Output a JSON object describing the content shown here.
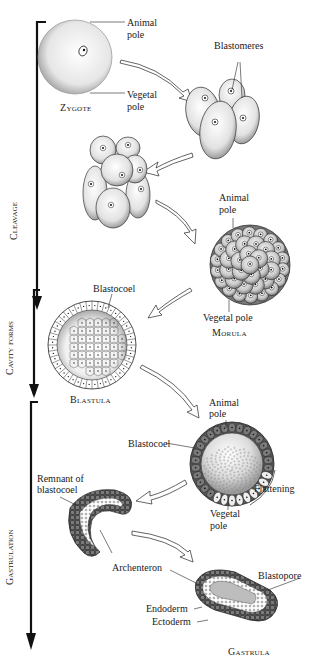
{
  "phases": [
    {
      "id": "cleavage",
      "label": "Cleavage"
    },
    {
      "id": "cavity",
      "label": "Cavity forms"
    },
    {
      "id": "gastrulation",
      "label": "Gastrulation"
    }
  ],
  "stages": {
    "zygote": {
      "name": "Zygote",
      "labels": {
        "animal_pole": "Animal\npole",
        "vegetal_pole": "Vegetal\npole"
      }
    },
    "four_cell": {
      "labels": {
        "blastomeres": "Blastomeres"
      }
    },
    "eight_cell": {},
    "morula": {
      "name": "Morula",
      "labels": {
        "animal_pole": "Animal\npole",
        "vegetal_pole": "Vegetal pole"
      }
    },
    "blastula": {
      "name": "Blastula",
      "labels": {
        "blastocoel": "Blastocoel"
      }
    },
    "early_gastrula": {
      "labels": {
        "animal_pole": "Animal\npole",
        "blastocoel": "Blastocoel",
        "flattening": "Flattening",
        "vegetal_pole": "Vegetal\npole"
      }
    },
    "mid_gastrula": {
      "labels": {
        "remnant": "Remnant of\nblastocoel",
        "archenteron": "Archenteron"
      }
    },
    "gastrula": {
      "name": "Gastrula",
      "labels": {
        "blastopore": "Blastopore",
        "endoderm": "Endoderm",
        "ectoderm": "Ectoderm"
      }
    }
  },
  "colors": {
    "line": "#111111",
    "cell_fill": "#f2f2f2",
    "stipple": "#9a9a9a",
    "dark_ectoderm": "#4a4a4a",
    "background": "#ffffff"
  }
}
